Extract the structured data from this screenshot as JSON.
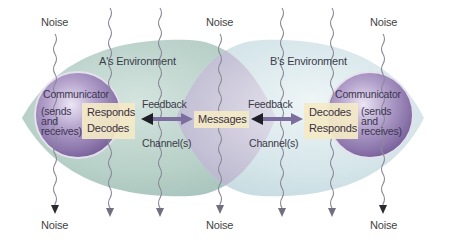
{
  "diagram": {
    "type": "communication-model",
    "environments": [
      {
        "id": "A",
        "label": "A's Environment"
      },
      {
        "id": "B",
        "label": "B's Environment"
      }
    ],
    "communicators": [
      {
        "id": "A",
        "title": "Communicator",
        "desc_lines": [
          "(sends",
          "and",
          "receives)"
        ],
        "process_lines": [
          "Responds",
          "Decodes"
        ]
      },
      {
        "id": "B",
        "title": "Communicator",
        "desc_lines": [
          "(sends",
          "and",
          "receives)"
        ],
        "process_lines": [
          "Decodes",
          "Responds"
        ]
      }
    ],
    "center": {
      "label": "Messages"
    },
    "links": [
      {
        "top": "Feedback",
        "bottom": "Channel(s)"
      },
      {
        "top": "Feedback",
        "bottom": "Channel(s)"
      }
    ],
    "noise": {
      "top": [
        "Noise",
        "Noise",
        "Noise"
      ],
      "bottom": [
        "Noise",
        "Noise",
        "Noise"
      ]
    },
    "colors": {
      "env_a": "#b9d3cc",
      "env_b": "#d6e6ea",
      "overlap": "#c9c6d8",
      "sphere": "#9a86b8",
      "box": "#f3e9c6",
      "arrow": "#7a6a9c",
      "wave": "#8a8a98"
    }
  }
}
